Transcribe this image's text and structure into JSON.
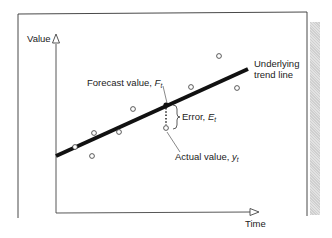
{
  "diagram": {
    "y_axis_label": "Value",
    "x_axis_label": "Time",
    "trend_label_line1": "Underlying",
    "trend_label_line2": "trend line",
    "forecast_label_prefix": "Forecast value, ",
    "forecast_symbol": "F",
    "forecast_subscript": "t",
    "error_label_prefix": "Error, ",
    "error_symbol": "E",
    "error_subscript": "t",
    "actual_label_prefix": "Actual value, ",
    "actual_symbol": "y",
    "actual_subscript": "t"
  },
  "chart_data": {
    "type": "scatter",
    "title": "",
    "xlabel": "Time",
    "ylabel": "Value",
    "trend_line": {
      "x1": 56,
      "y1": 156,
      "x2": 248,
      "y2": 69
    },
    "observations": [
      {
        "x": 75,
        "y": 147
      },
      {
        "x": 92,
        "y": 156
      },
      {
        "x": 94,
        "y": 133
      },
      {
        "x": 119,
        "y": 132
      },
      {
        "x": 133,
        "y": 109
      },
      {
        "x": 166,
        "y": 128
      },
      {
        "x": 191,
        "y": 87
      },
      {
        "x": 219,
        "y": 56
      },
      {
        "x": 237,
        "y": 88
      }
    ],
    "forecast_point": {
      "x": 166,
      "y": 105
    },
    "actual_point": {
      "x": 166,
      "y": 128
    },
    "grid": false
  }
}
